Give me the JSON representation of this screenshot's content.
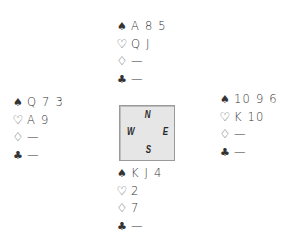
{
  "suits": {
    "spades": "♠",
    "hearts": "♡",
    "diamonds": "♢",
    "clubs": "♣"
  },
  "compass": {
    "north": "N",
    "south": "S",
    "east": "E",
    "west": "W"
  },
  "hands": {
    "north": {
      "spades": "A 8 5",
      "hearts": "Q J",
      "diamonds": "—",
      "clubs": "—"
    },
    "west": {
      "spades": "Q 7 3",
      "hearts": "A 9",
      "diamonds": "—",
      "clubs": "—"
    },
    "east": {
      "spades": "10 9 6",
      "hearts": "K 10",
      "diamonds": "—",
      "clubs": "—"
    },
    "south": {
      "spades": "K J 4",
      "hearts": "2",
      "diamonds": "7",
      "clubs": "—"
    }
  }
}
